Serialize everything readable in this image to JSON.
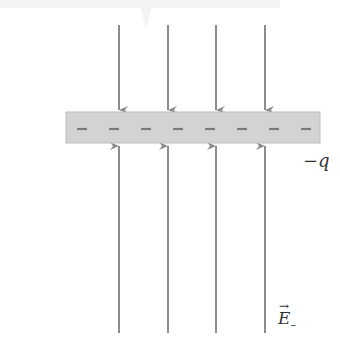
{
  "diagram": {
    "plate": {
      "charge_label": "−q",
      "charge_signs": [
        "–",
        "–",
        "–",
        "–",
        "–",
        "–",
        "–",
        "–"
      ],
      "fill": "#d3d3d3",
      "border": "#b8b8b8",
      "sign_color": "#7a7a7a"
    },
    "field": {
      "label": "E",
      "subscript": "–",
      "vector_arrow": "→",
      "line_color": "#8c8c8c"
    },
    "field_lines_x": [
      119,
      168,
      216,
      265
    ]
  }
}
